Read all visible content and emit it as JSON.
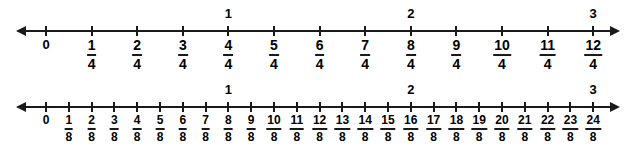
{
  "figure": {
    "background_color": "#ffffff",
    "ink_color": "#1a1a1a"
  },
  "lines": [
    {
      "id": "quarters",
      "name": "number-line-quarters",
      "denominator": "4",
      "axis": {
        "start_x": 26,
        "end_x": 610,
        "y": 30
      },
      "tick_start_x": 46,
      "tick_spacing": 45.6,
      "tick_count": 13,
      "labels": [
        {
          "whole": "0"
        },
        {
          "num": "1",
          "den": "4"
        },
        {
          "num": "2",
          "den": "4"
        },
        {
          "num": "3",
          "den": "4"
        },
        {
          "num": "4",
          "den": "4"
        },
        {
          "num": "5",
          "den": "4"
        },
        {
          "num": "6",
          "den": "4"
        },
        {
          "num": "7",
          "den": "4"
        },
        {
          "num": "8",
          "den": "4"
        },
        {
          "num": "9",
          "den": "4"
        },
        {
          "num": "10",
          "den": "4"
        },
        {
          "num": "11",
          "den": "4"
        },
        {
          "num": "12",
          "den": "4"
        }
      ],
      "whole_labels": [
        {
          "text": "1",
          "tick_index": 4
        },
        {
          "text": "2",
          "tick_index": 8
        },
        {
          "text": "3",
          "tick_index": 12
        }
      ]
    },
    {
      "id": "eighths",
      "name": "number-line-eighths",
      "denominator": "8",
      "axis": {
        "start_x": 26,
        "end_x": 610,
        "y": 106
      },
      "tick_start_x": 46,
      "tick_spacing": 22.8,
      "tick_count": 25,
      "labels": [
        {
          "whole": "0"
        },
        {
          "num": "1",
          "den": "8"
        },
        {
          "num": "2",
          "den": "8"
        },
        {
          "num": "3",
          "den": "8"
        },
        {
          "num": "4",
          "den": "8"
        },
        {
          "num": "5",
          "den": "8"
        },
        {
          "num": "6",
          "den": "8"
        },
        {
          "num": "7",
          "den": "8"
        },
        {
          "num": "8",
          "den": "8"
        },
        {
          "num": "9",
          "den": "8"
        },
        {
          "num": "10",
          "den": "8"
        },
        {
          "num": "11",
          "den": "8"
        },
        {
          "num": "12",
          "den": "8"
        },
        {
          "num": "13",
          "den": "8"
        },
        {
          "num": "14",
          "den": "8"
        },
        {
          "num": "15",
          "den": "8"
        },
        {
          "num": "16",
          "den": "8"
        },
        {
          "num": "17",
          "den": "8"
        },
        {
          "num": "18",
          "den": "8"
        },
        {
          "num": "19",
          "den": "8"
        },
        {
          "num": "20",
          "den": "8"
        },
        {
          "num": "21",
          "den": "8"
        },
        {
          "num": "22",
          "den": "8"
        },
        {
          "num": "23",
          "den": "8"
        },
        {
          "num": "24",
          "den": "8"
        }
      ],
      "whole_labels": [
        {
          "text": "1",
          "tick_index": 8
        },
        {
          "text": "2",
          "tick_index": 16
        },
        {
          "text": "3",
          "tick_index": 24
        }
      ]
    }
  ]
}
